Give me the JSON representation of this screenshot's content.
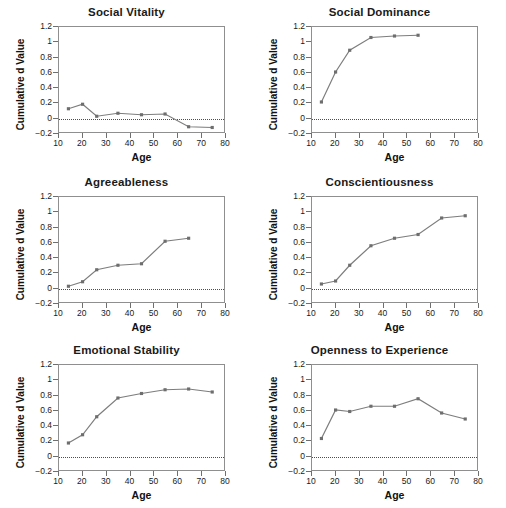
{
  "figure": {
    "background": "#ffffff",
    "line_color": "#7d7d7d",
    "marker_color": "#6e6e6e",
    "axis_color": "#8f8f8f"
  },
  "axes_common": {
    "xlabel": "Age",
    "ylabel": "Cumulative d Value",
    "xlim": [
      10,
      80
    ],
    "ylim": [
      -0.2,
      1.2
    ],
    "xticks": [
      10,
      20,
      30,
      40,
      50,
      60,
      70,
      80
    ],
    "xtick_labels": [
      "10",
      "20",
      "30",
      "40",
      "50",
      "60",
      "70",
      "80"
    ],
    "yticks": [
      -0.2,
      0,
      0.2,
      0.4,
      0.6,
      0.8,
      1.0,
      1.2
    ],
    "ytick_labels": [
      "−0.2",
      "0",
      "0.2",
      "0.4",
      "0.6",
      "0.8",
      "1",
      "1.2"
    ],
    "zero_reference_line": 0,
    "grid": false,
    "legend": "none"
  },
  "chart_data": [
    {
      "type": "line",
      "title": "Social Vitality",
      "xlabel": "Age",
      "ylabel": "Cumulative d Value",
      "xlim": [
        10,
        80
      ],
      "ylim": [
        -0.2,
        1.2
      ],
      "x": [
        14,
        20,
        26,
        35,
        45,
        55,
        65,
        75
      ],
      "values": [
        0.11,
        0.17,
        0.01,
        0.05,
        0.03,
        0.04,
        -0.13,
        -0.14
      ]
    },
    {
      "type": "line",
      "title": "Social Dominance",
      "xlabel": "Age",
      "ylabel": "Cumulative d Value",
      "xlim": [
        10,
        80
      ],
      "ylim": [
        -0.2,
        1.2
      ],
      "x": [
        14,
        20,
        26,
        35,
        45,
        55
      ],
      "values": [
        0.2,
        0.6,
        0.89,
        1.06,
        1.08,
        1.09
      ]
    },
    {
      "type": "line",
      "title": "Agreeableness",
      "xlabel": "Age",
      "ylabel": "Cumulative d Value",
      "xlim": [
        10,
        80
      ],
      "ylim": [
        -0.2,
        1.2
      ],
      "x": [
        14,
        20,
        26,
        35,
        45,
        55,
        65
      ],
      "values": [
        0.01,
        0.07,
        0.23,
        0.29,
        0.31,
        0.61,
        0.65
      ]
    },
    {
      "type": "line",
      "title": "Conscientiousness",
      "xlabel": "Age",
      "ylabel": "Cumulative d Value",
      "xlim": [
        10,
        80
      ],
      "ylim": [
        -0.2,
        1.2
      ],
      "x": [
        14,
        20,
        26,
        35,
        45,
        55,
        65,
        75
      ],
      "values": [
        0.04,
        0.08,
        0.29,
        0.55,
        0.65,
        0.7,
        0.92,
        0.95
      ]
    },
    {
      "type": "line",
      "title": "Emotional Stability",
      "xlabel": "Age",
      "ylabel": "Cumulative d Value",
      "xlim": [
        10,
        80
      ],
      "ylim": [
        -0.2,
        1.2
      ],
      "x": [
        14,
        20,
        26,
        35,
        45,
        55,
        65,
        75
      ],
      "values": [
        0.16,
        0.27,
        0.51,
        0.76,
        0.82,
        0.87,
        0.88,
        0.84
      ]
    },
    {
      "type": "line",
      "title": "Openness to Experience",
      "xlabel": "Age",
      "ylabel": "Cumulative d Value",
      "xlim": [
        10,
        80
      ],
      "ylim": [
        -0.2,
        1.2
      ],
      "x": [
        14,
        20,
        26,
        35,
        45,
        55,
        65,
        75
      ],
      "values": [
        0.22,
        0.6,
        0.58,
        0.65,
        0.65,
        0.75,
        0.56,
        0.48
      ]
    }
  ]
}
